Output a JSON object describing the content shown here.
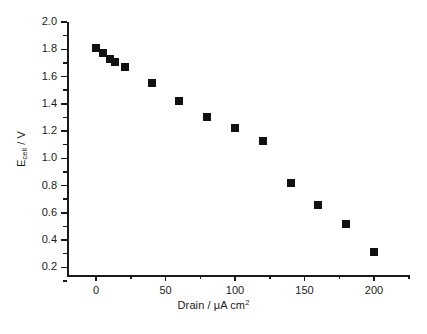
{
  "chart_data": {
    "type": "scatter",
    "title": "",
    "xlabel": "Drain / μA cm",
    "xlabel_sup": "2",
    "ylabel_main": "E",
    "ylabel_sub": "cell",
    "ylabel_tail": " / V",
    "xlabel_full": "Drain / μA cm2",
    "ylabel_full": "Ecell / V",
    "xlim": [
      -12,
      221
    ],
    "ylim": [
      0.1,
      2.06
    ],
    "x_major_ticks": [
      0,
      50,
      100,
      150,
      200
    ],
    "x_minor_step": 25,
    "y_major_ticks": [
      0.2,
      0.4,
      0.6,
      0.8,
      1.0,
      1.2,
      1.4,
      1.6,
      1.8,
      2.0
    ],
    "y_minor_step": 0.1,
    "x_tick_labels": [
      "0",
      "50",
      "100",
      "150",
      "200"
    ],
    "y_tick_labels": [
      "0.2",
      "0.4",
      "0.6",
      "0.8",
      "1.0",
      "1.2",
      "1.4",
      "1.6",
      "1.8",
      "2.0"
    ],
    "grid": false,
    "legend": null,
    "marker": "square",
    "marker_color": "#111111",
    "marker_size_px": 8,
    "series": [
      {
        "name": "Ecell vs Drain",
        "x": [
          0,
          5,
          10,
          14,
          21,
          40,
          60,
          80,
          100,
          120,
          140,
          160,
          180,
          200
        ],
        "y": [
          1.81,
          1.77,
          1.73,
          1.71,
          1.67,
          1.55,
          1.42,
          1.3,
          1.22,
          1.13,
          0.82,
          0.66,
          0.52,
          0.31
        ]
      }
    ]
  },
  "axes": {
    "plot_left_px": 67,
    "plot_right_px": 410,
    "plot_top_px": 22,
    "plot_bottom_px": 275,
    "x0_px": 96,
    "x_scale_px_per_unit": 1.39,
    "y_top_value": 2.0,
    "y_top_px": 22,
    "y_px_per_volt": 136.25
  }
}
